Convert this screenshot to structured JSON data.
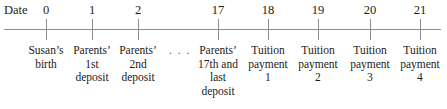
{
  "figure": {
    "axis_label": "Date",
    "gap_marker": ". . .",
    "axis_color": "#8d8d8d",
    "text_color": "#1b1b1b"
  },
  "chart_data": {
    "type": "timeline",
    "title": "",
    "xlabel": "Date",
    "grid": false,
    "legend": null,
    "axis_ticks": [
      0,
      1,
      2,
      17,
      18,
      19,
      20,
      21
    ],
    "gap_between": [
      2,
      17
    ],
    "gap_symbol": ". . .",
    "events": [
      {
        "date": "0",
        "x_px": 46,
        "lines": [
          "Susan’s",
          "birth"
        ]
      },
      {
        "date": "1",
        "x_px": 92,
        "lines": [
          "Parents’",
          "1st",
          "deposit"
        ]
      },
      {
        "date": "2",
        "x_px": 138,
        "lines": [
          "Parents’",
          "2nd",
          "deposit"
        ]
      },
      {
        "date": "17",
        "x_px": 218,
        "lines": [
          "Parents’",
          "17th and",
          "last",
          "deposit"
        ]
      },
      {
        "date": "18",
        "x_px": 268,
        "lines": [
          "Tuition",
          "payment",
          "1"
        ]
      },
      {
        "date": "19",
        "x_px": 318,
        "lines": [
          "Tuition",
          "payment",
          "2"
        ]
      },
      {
        "date": "20",
        "x_px": 370,
        "lines": [
          "Tuition",
          "payment",
          "3"
        ]
      },
      {
        "date": "21",
        "x_px": 420,
        "lines": [
          "Tuition",
          "payment",
          "4"
        ]
      }
    ],
    "gap_marker_x_px": 180
  }
}
